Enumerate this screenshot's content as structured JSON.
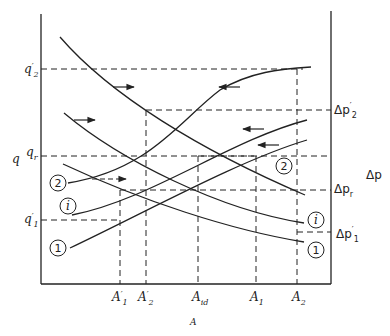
{
  "diagram": {
    "x_axis_title": "A",
    "y_axis_left_title": "q",
    "y_axis_right_title": "Δp",
    "left_ticks": [
      {
        "base": "q",
        "sup": "′",
        "sub": "2"
      },
      {
        "base": "q",
        "sup": "",
        "sub": "r"
      },
      {
        "base": "q",
        "sup": "′",
        "sub": "1"
      }
    ],
    "right_ticks": [
      {
        "base": "Δp",
        "sup": "′",
        "sub": "2"
      },
      {
        "base": "Δp",
        "sup": "",
        "sub": "r"
      },
      {
        "base": "Δp",
        "sup": "′",
        "sub": "1"
      }
    ],
    "bottom_ticks": [
      {
        "base": "A",
        "sup": "′",
        "sub": "1"
      },
      {
        "base": "A",
        "sup": "′",
        "sub": "2"
      },
      {
        "base": "A",
        "sup": "",
        "sub": "id"
      },
      {
        "base": "A",
        "sup": "",
        "sub": "1"
      },
      {
        "base": "A",
        "sup": "",
        "sub": "2"
      }
    ],
    "curve_labels": {
      "rising_2": "2",
      "rising_i": "i",
      "rising_1": "1",
      "falling_2": "2",
      "falling_i": "i",
      "falling_1": "1"
    },
    "curves": {
      "rising": [
        "2",
        "i",
        "1"
      ],
      "falling": [
        "2",
        "i",
        "1"
      ]
    },
    "arrows": [
      {
        "direction": "right",
        "near": "falling curve 2"
      },
      {
        "direction": "right",
        "near": "falling curve i"
      },
      {
        "direction": "right",
        "near": "rising curve 2 (dashed)"
      },
      {
        "direction": "left",
        "near": "rising curve 2"
      },
      {
        "direction": "left",
        "near": "rising curve i"
      },
      {
        "direction": "left",
        "near": "rising curve 1"
      }
    ]
  }
}
